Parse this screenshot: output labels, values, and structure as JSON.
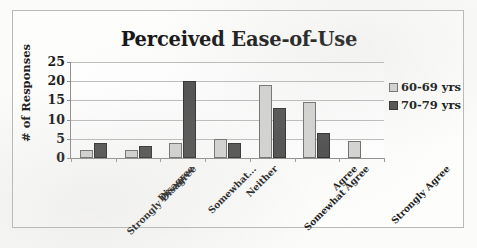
{
  "chart_data": {
    "type": "bar",
    "title": "Perceived Ease-of-Use",
    "xlabel": "",
    "ylabel": "# of Responses",
    "ylim": [
      0,
      25
    ],
    "yticks": [
      0,
      5,
      10,
      15,
      20,
      25
    ],
    "grid": true,
    "legend_position": "right",
    "categories": [
      "Strongly Disagree",
      "Disagree",
      "Somewhat...",
      "Neither",
      "Somewhat Agree",
      "Agree",
      "Strongly Agree"
    ],
    "series": [
      {
        "name": "60-69 yrs",
        "color": "#d4d4d2",
        "values": [
          2,
          2,
          4,
          5,
          19,
          14.5,
          4.5
        ]
      },
      {
        "name": "70-79 yrs",
        "color": "#4d4d4d",
        "values": [
          4,
          3,
          20,
          4,
          13,
          6.5,
          0
        ]
      }
    ]
  },
  "legend": {
    "items": [
      {
        "label": "60-69 yrs"
      },
      {
        "label": "70-79 yrs"
      }
    ]
  },
  "axis": {
    "y_tick_labels": [
      "25",
      "20",
      "15",
      "10",
      "5",
      "0"
    ],
    "y_title": "# of Responses"
  }
}
